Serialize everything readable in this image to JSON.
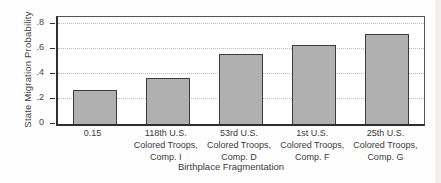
{
  "chart_data": {
    "type": "bar",
    "title": "",
    "xlabel": "Birthplace Fragmentation",
    "ylabel": "State Migration Probability",
    "categories": [
      "0.15",
      "118th U.S. Colored Troops, Comp. I",
      "53rd U.S. Colored Troops, Comp. D",
      "1st U.S. Colored Troops, Comp. F",
      "25th U.S. Colored Troops, Comp. G"
    ],
    "category_lines": [
      [
        "0.15"
      ],
      [
        "118th U.S.",
        "Colored Troops,",
        "Comp. I"
      ],
      [
        "53rd U.S.",
        "Colored Troops,",
        "Comp. D"
      ],
      [
        "1st U.S.",
        "Colored Troops,",
        "Comp. F"
      ],
      [
        "25th U.S.",
        "Colored Troops,",
        "Comp. G"
      ]
    ],
    "values": [
      0.27,
      0.37,
      0.56,
      0.63,
      0.72
    ],
    "yticks": [
      "0",
      ".2",
      ".4",
      ".6",
      ".8"
    ],
    "ytick_values": [
      0,
      0.2,
      0.4,
      0.6,
      0.8
    ],
    "ylim": [
      0,
      0.856
    ],
    "grid": "horizontal-dotted",
    "legend": "none",
    "bar_color": "#b0b0b0",
    "bar_border_color": "#3c3c3c",
    "axis_color": "#2e2e2e",
    "gridline_color": "#bcbcbc"
  }
}
